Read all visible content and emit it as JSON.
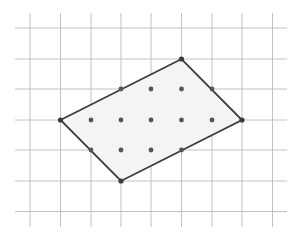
{
  "diagram": {
    "type": "lattice-polygon-on-grid",
    "canvas": {
      "width": 298,
      "height": 238
    },
    "grid": {
      "x_lines": [
        30,
        60.5,
        91,
        121,
        151,
        181.5,
        212,
        242,
        272.5
      ],
      "y_lines": [
        28,
        59,
        89,
        120,
        150,
        181,
        211.5
      ],
      "extent": {
        "x_min": 15,
        "x_max": 287,
        "y_min": 13,
        "y_max": 227
      },
      "color": "#c2c2c2"
    },
    "polygon": {
      "vertices_grid": [
        [
          1,
          3
        ],
        [
          5,
          1
        ],
        [
          7,
          3
        ],
        [
          3,
          5
        ]
      ],
      "vertex_labels": [
        "left",
        "top",
        "right",
        "bottom"
      ],
      "edge_color": "#3c3c3c",
      "fill_color": "#f4f4f4"
    },
    "boundary_points_grid": [
      [
        1,
        3
      ],
      [
        3,
        2
      ],
      [
        5,
        1
      ],
      [
        6,
        2
      ],
      [
        7,
        3
      ],
      [
        5,
        4
      ],
      [
        3,
        5
      ],
      [
        2,
        4
      ]
    ],
    "interior_points_grid": [
      [
        4,
        2
      ],
      [
        5,
        2
      ],
      [
        2,
        3
      ],
      [
        3,
        3
      ],
      [
        4,
        3
      ],
      [
        5,
        3
      ],
      [
        6,
        3
      ],
      [
        3,
        4
      ],
      [
        4,
        4
      ]
    ],
    "dot_color": "#555555"
  }
}
